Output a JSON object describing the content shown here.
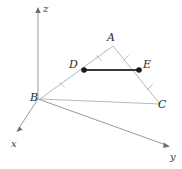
{
  "figure": {
    "background_color": "#ffffff",
    "width": 182,
    "height": 169
  },
  "axes": {
    "origin": {
      "x": 38,
      "y": 99
    },
    "items": [
      {
        "name": "z",
        "label": "z",
        "label_x": 43,
        "label_y": 4,
        "tip_x": 38,
        "tip_y": 9,
        "color": "#9a9a9a"
      },
      {
        "name": "x",
        "label": "x",
        "label_x": 11,
        "label_y": 139,
        "tip_x": 17,
        "tip_y": 130,
        "color": "#9a9a9a"
      },
      {
        "name": "y",
        "label": "y",
        "label_x": 170,
        "label_y": 152,
        "tip_x": 168,
        "tip_y": 146,
        "color": "#9a9a9a"
      }
    ]
  },
  "triangle": {
    "name": "ABC",
    "side_color": "#b0b0b0",
    "vertices": [
      {
        "label": "A",
        "x": 113,
        "y": 46,
        "label_x": 107,
        "label_y": 32,
        "dot": false
      },
      {
        "label": "B",
        "x": 40,
        "y": 99,
        "label_x": 30,
        "label_y": 92,
        "dot": false
      },
      {
        "label": "C",
        "x": 160,
        "y": 104,
        "label_x": 158,
        "label_y": 99,
        "dot": false
      }
    ]
  },
  "midsegment": {
    "name": "DE",
    "color": "#3a3a3a",
    "endpoints": [
      {
        "label": "D",
        "x": 84,
        "y": 70,
        "label_x": 69,
        "label_y": 59,
        "dot": true
      },
      {
        "label": "E",
        "x": 139,
        "y": 70,
        "label_x": 143,
        "label_y": 59,
        "dot": true
      }
    ]
  },
  "tick_marks": [
    {
      "name": "tick-ad",
      "on_segment": "A-D",
      "x": 99,
      "y": 58,
      "angle": 55
    },
    {
      "name": "tick-db",
      "on_segment": "D-B",
      "x": 62,
      "y": 85,
      "angle": 55
    },
    {
      "name": "tick-ae",
      "on_segment": "A-E",
      "x": 126,
      "y": 58,
      "angle": -62
    },
    {
      "name": "tick-ec",
      "on_segment": "E-C",
      "x": 150,
      "y": 87,
      "angle": -62
    }
  ]
}
